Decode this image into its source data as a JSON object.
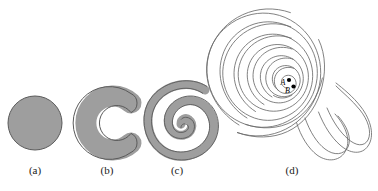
{
  "figure": {
    "background_color": "#ffffff",
    "shape_fill_color": "#9e9e9e",
    "shape_stroke_color": "#5a5a5a",
    "line_color": "#6b6b6b",
    "point_color": "#000000",
    "panels": [
      {
        "id": "panel-a",
        "caption": "(a)",
        "shape_name": "filled-disk",
        "description": "Solid filled gray disk"
      },
      {
        "id": "panel-b",
        "caption": "(b)",
        "shape_name": "c-shape",
        "description": "Thick gray C shape, opening facing right"
      },
      {
        "id": "panel-c",
        "caption": "(c)",
        "shape_name": "thick-spiral",
        "description": "Thick gray spiral band with about two turns"
      },
      {
        "id": "panel-d",
        "caption": "(d)",
        "shape_name": "thin-outline-spiral",
        "description": "Large thin outline spiral band with many turns",
        "points": [
          {
            "label": "A"
          },
          {
            "label": "B"
          }
        ]
      }
    ]
  }
}
